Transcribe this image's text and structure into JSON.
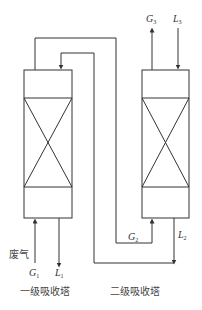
{
  "diagram": {
    "columns": [
      {
        "id": "column-1",
        "label": "一级吸收塔"
      },
      {
        "id": "column-2",
        "label": "二级吸收塔"
      }
    ],
    "streams": {
      "G1": {
        "symbol": "G",
        "subscript": "1",
        "annotation": "废气"
      },
      "L1": {
        "symbol": "L",
        "subscript": "1"
      },
      "G2": {
        "symbol": "G",
        "subscript": "2"
      },
      "L2": {
        "symbol": "L",
        "subscript": "2"
      },
      "G3": {
        "symbol": "G",
        "subscript": "3"
      },
      "L3": {
        "symbol": "L",
        "subscript": "3"
      }
    },
    "colors": {
      "line": "#333333",
      "text": "#444444",
      "background": "#ffffff"
    }
  }
}
